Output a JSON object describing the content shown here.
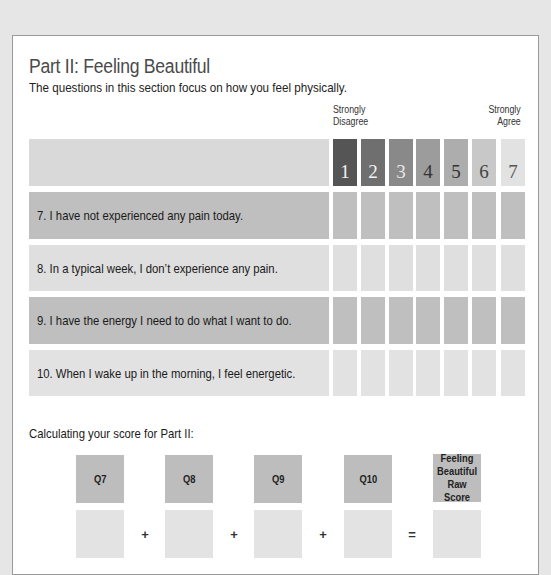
{
  "section": {
    "title": "Part II: Feeling Beautiful",
    "subtitle": "The questions in this section focus on how you feel physically."
  },
  "scale": {
    "left_label_line1": "Strongly",
    "left_label_line2": "Disagree",
    "right_label_line1": "Strongly",
    "right_label_line2": "Agree",
    "points": [
      {
        "label": "1",
        "color": "#555555",
        "text_color": "#f2f2f2"
      },
      {
        "label": "2",
        "color": "#6f6f6f",
        "text_color": "#f2f2f2"
      },
      {
        "label": "3",
        "color": "#898989",
        "text_color": "#e8e8e8"
      },
      {
        "label": "4",
        "color": "#9c9c9c",
        "text_color": "#333333"
      },
      {
        "label": "5",
        "color": "#adadad",
        "text_color": "#333333"
      },
      {
        "label": "6",
        "color": "#c8c8c8",
        "text_color": "#444444"
      },
      {
        "label": "7",
        "color": "#e2e2e2",
        "text_color": "#555555"
      }
    ]
  },
  "questions": [
    {
      "text": "7. I have not experienced any pain today.",
      "bg": "#bfbfbf"
    },
    {
      "text": "8. In a typical week, I don’t experience any pain.",
      "bg": "#dfdfdf"
    },
    {
      "text": "9. I have the energy I need to do what I want to do.",
      "bg": "#bfbfbf"
    },
    {
      "text": "10. When I wake up in the morning, I feel energetic.",
      "bg": "#e2e2e2"
    }
  ],
  "calculation": {
    "label": "Calculating your score for Part II:",
    "boxes": [
      {
        "label": "Q7"
      },
      {
        "label": "Q8"
      },
      {
        "label": "Q9"
      },
      {
        "label": "Q10"
      },
      {
        "label": "Feeling Beautiful Raw Score"
      }
    ],
    "operators": [
      "+",
      "+",
      "+",
      "="
    ]
  },
  "colors": {
    "header_row_bg": "#d9d9d9",
    "dark_row_bg": "#bfbfbf",
    "light_row_bg": "#e0e0e0",
    "label_box_bg": "#bdbdbd",
    "input_box_bg": "#e3e3e3"
  }
}
